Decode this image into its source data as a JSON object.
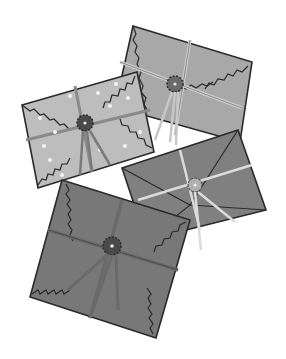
{
  "illustration": {
    "subject": "four envelopes tied with string",
    "colors": {
      "background": "#ffffff",
      "outline": "#2a2a2a",
      "top_envelope": "#a8a8a8",
      "dotted_envelope": "#bdbdbd",
      "right_envelope": "#808080",
      "bottom_envelope": "#787878",
      "string": "#c8c8c8",
      "seal_dark": "#4a4a4a",
      "seal_light": "#b0b0b0",
      "dots": "#f2f2f2"
    }
  }
}
